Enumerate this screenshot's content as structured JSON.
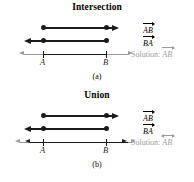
{
  "figure": {
    "panels": [
      {
        "id": "a",
        "title": "Intersection",
        "caption": "(a)",
        "point_labels": {
          "left": "A",
          "right": "B"
        },
        "rows": [
          {
            "name": "ray-ab",
            "label": "AB",
            "label_arrow": "right",
            "description": "ray from A through B, arrow to the right"
          },
          {
            "name": "ray-ba",
            "label": "BA",
            "label_arrow": "right",
            "description": "ray from B through A, arrow to the left"
          },
          {
            "name": "solution",
            "label_prefix": "Solution:",
            "label": "AB",
            "label_arrow": "bar",
            "description": "segment AB highlighted between A and B on a gray line"
          }
        ]
      },
      {
        "id": "b",
        "title": "Union",
        "caption": "(b)",
        "point_labels": {
          "left": "A",
          "right": "B"
        },
        "rows": [
          {
            "name": "ray-ab",
            "label": "AB",
            "label_arrow": "right",
            "description": "ray from A through B, arrow to the right"
          },
          {
            "name": "ray-ba",
            "label": "BA",
            "label_arrow": "right",
            "description": "ray from B through A, arrow to the left"
          },
          {
            "name": "solution",
            "label_prefix": "Solution:",
            "label": "AB",
            "label_arrow": "both",
            "description": "entire line AB, arrows on both ends"
          }
        ]
      }
    ],
    "colors": {
      "ink": "#1a1a1a",
      "gray": "#9c9c9c",
      "tick": "#6e6e6e",
      "background": "#ffffff"
    }
  }
}
